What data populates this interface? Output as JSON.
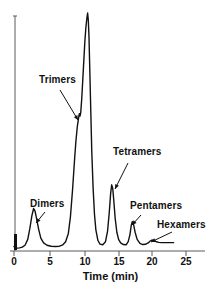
{
  "chart_data": {
    "type": "line",
    "title": "",
    "subtitle": "",
    "xlabel": "Time (min)",
    "ylabel": "",
    "xlim": [
      0,
      26.5
    ],
    "ylim": [
      0,
      100
    ],
    "grid": false,
    "legend": "none",
    "xticks": [
      0,
      5,
      10,
      15,
      20,
      25
    ],
    "xticklabels": [
      "0",
      "5",
      "10",
      "15",
      "20",
      "25"
    ],
    "yticks": [],
    "yticklabels": [],
    "series": [
      {
        "name": "chromatogram",
        "color": "#111111",
        "x": [
          0.0,
          0.15,
          0.3,
          0.5,
          0.8,
          1.2,
          1.6,
          2.0,
          2.3,
          2.6,
          2.85,
          3.05,
          3.3,
          3.6,
          3.9,
          4.3,
          4.8,
          5.4,
          6.0,
          6.6,
          7.1,
          7.5,
          7.9,
          8.2,
          8.5,
          8.8,
          9.0,
          9.2,
          9.4,
          9.5,
          9.6,
          9.7,
          9.85,
          10.0,
          10.15,
          10.3,
          10.45,
          10.6,
          10.7,
          10.8,
          10.9,
          11.0,
          11.15,
          11.3,
          11.5,
          11.7,
          11.9,
          12.2,
          12.5,
          12.9,
          13.3,
          13.6,
          13.85,
          14.05,
          14.2,
          14.35,
          14.5,
          14.7,
          14.95,
          15.2,
          15.5,
          15.9,
          16.3,
          16.6,
          16.85,
          17.05,
          17.2,
          17.4,
          17.6,
          17.9,
          18.3,
          18.7,
          19.1,
          19.5,
          19.8,
          20.05,
          20.3,
          20.6,
          21.0,
          21.5,
          22.0,
          22.6,
          23.2
        ],
        "y": [
          1.5,
          1.0,
          0.8,
          0.8,
          0.9,
          1.2,
          2.0,
          4.5,
          9.0,
          14.5,
          17.5,
          16.5,
          13.0,
          8.5,
          5.0,
          3.0,
          2.0,
          1.6,
          1.5,
          1.6,
          2.2,
          3.5,
          7.0,
          14.0,
          25.0,
          38.0,
          46.0,
          52.0,
          56.0,
          57.5,
          56.5,
          58.0,
          64.0,
          72.0,
          80.0,
          88.0,
          94.0,
          98.0,
          100.0,
          97.0,
          90.0,
          78.0,
          60.0,
          42.0,
          26.0,
          15.0,
          8.5,
          4.0,
          2.5,
          2.2,
          3.5,
          8.0,
          16.0,
          24.0,
          27.5,
          26.0,
          21.0,
          13.5,
          7.5,
          4.5,
          3.0,
          2.3,
          2.2,
          3.5,
          6.5,
          10.5,
          12.0,
          10.5,
          7.5,
          4.5,
          2.8,
          2.3,
          2.4,
          3.0,
          3.8,
          4.2,
          4.0,
          3.6,
          3.2,
          3.1,
          3.1,
          3.1,
          3.1
        ]
      }
    ],
    "peaks": [
      {
        "name": "Dimers",
        "time_min": 2.85,
        "height_pct": 17.5
      },
      {
        "name": "Trimers",
        "time_min": 10.7,
        "height_pct": 100.0
      },
      {
        "name": "Tetramers",
        "time_min": 14.2,
        "height_pct": 27.5
      },
      {
        "name": "Pentamers",
        "time_min": 17.2,
        "height_pct": 12.0
      },
      {
        "name": "Hexamers",
        "time_min": 20.05,
        "height_pct": 4.2
      }
    ],
    "annotations": [
      {
        "text": "Trimers",
        "label_x": 39,
        "label_y": 74,
        "arrow_from_x": 60,
        "arrow_from_y": 90,
        "arrow_to_x": 78,
        "arrow_to_y": 120
      },
      {
        "text": "Tetramers",
        "label_x": 113,
        "label_y": 146,
        "arrow_from_x": 128,
        "arrow_from_y": 163,
        "arrow_to_x": 115,
        "arrow_to_y": 189
      },
      {
        "text": "Dimers",
        "label_x": 30,
        "label_y": 198,
        "arrow_from_x": 45,
        "arrow_from_y": 212,
        "arrow_to_x": 36,
        "arrow_to_y": 223
      },
      {
        "text": "Pentamers",
        "label_x": 130,
        "label_y": 200,
        "arrow_from_x": 141,
        "arrow_from_y": 215,
        "arrow_to_x": 132,
        "arrow_to_y": 225
      },
      {
        "text": "Hexamers",
        "label_x": 157,
        "label_y": 219,
        "arrow_from_x": 172,
        "arrow_from_y": 232,
        "arrow_to_x": 151,
        "arrow_to_y": 242
      }
    ]
  },
  "axes": {
    "x_title": "Time (min)",
    "tick_labels": [
      "0",
      "5",
      "10",
      "15",
      "20",
      "25"
    ],
    "tick_positions_px": [
      14,
      50,
      85,
      119,
      152,
      186
    ]
  },
  "labels": {
    "trimers": "Trimers",
    "tetramers": "Tetramers",
    "dimers": "Dimers",
    "pentamers": "Pentamers",
    "hexamers": "Hexamers"
  },
  "colors": {
    "trace": "#111111",
    "axis": "#4a4a4a",
    "text": "#111111",
    "background": "#ffffff"
  }
}
